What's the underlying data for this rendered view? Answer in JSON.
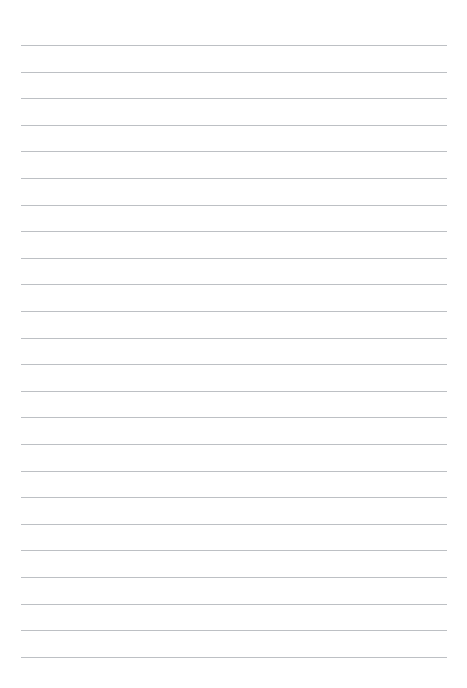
{
  "document": {
    "kind": "lined-writing-paper",
    "title": "",
    "page_width": 467,
    "page_height": 688,
    "background_color": "#ffffff",
    "content_text": "",
    "is_blank": "true"
  },
  "ruling": {
    "line_color": "#b9bdc1",
    "line_thickness_px": 1,
    "line_left_x": 21,
    "line_right_x": 447,
    "line_width_px": 426,
    "first_line_y": 45,
    "last_line_y": 657,
    "line_spacing_px": 26.6,
    "line_count": 24,
    "top_margin_px": 45,
    "bottom_margin_px": 31,
    "left_margin_px": 21,
    "right_margin_px": 20,
    "has_vertical_margin_rule": "false",
    "has_header": "false",
    "has_footer": "false",
    "has_page_number": "false",
    "line_y_positions": [
      45,
      71.6,
      98.2,
      124.8,
      151.4,
      178,
      204.6,
      231.2,
      257.8,
      284.4,
      311,
      337.6,
      364.2,
      390.8,
      417.4,
      444,
      470.6,
      497.2,
      523.8,
      550.4,
      577,
      603.6,
      630.2,
      656.8
    ]
  },
  "writing_rows": {
    "label": "writing-line",
    "count": 24,
    "values": [
      "",
      "",
      "",
      "",
      "",
      "",
      "",
      "",
      "",
      "",
      "",
      "",
      "",
      "",
      "",
      "",
      "",
      "",
      "",
      "",
      "",
      "",
      "",
      ""
    ]
  }
}
